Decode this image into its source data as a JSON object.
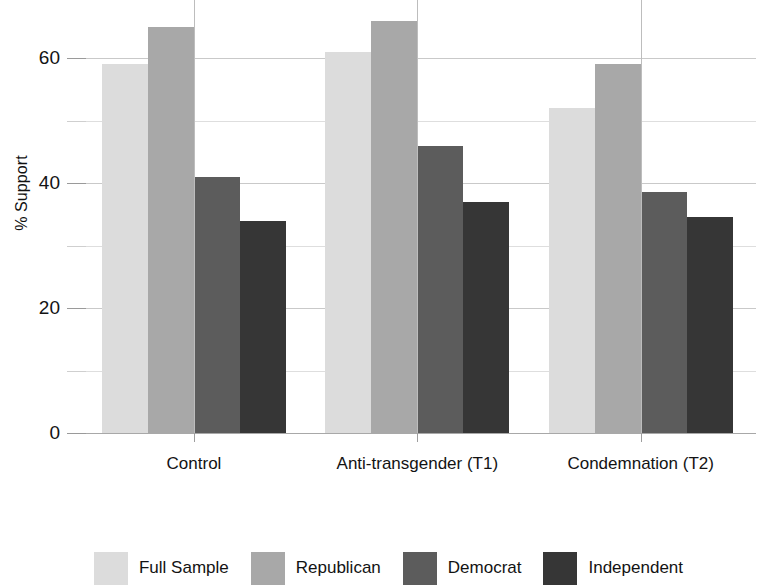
{
  "chart_data": {
    "type": "bar",
    "title": "",
    "subtitle": "",
    "xlabel": "",
    "ylabel": "% Support",
    "categories": [
      "Control",
      "Anti-transgender (T1)",
      "Condemnation (T2)"
    ],
    "series": [
      {
        "name": "Full Sample",
        "color": "#dcdcdc",
        "values": [
          59,
          61,
          52
        ]
      },
      {
        "name": "Republican",
        "color": "#a8a8a8",
        "values": [
          65,
          66,
          59
        ]
      },
      {
        "name": "Democrat",
        "color": "#5c5c5c",
        "values": [
          41,
          46,
          38.5
        ]
      },
      {
        "name": "Independent",
        "color": "#363636",
        "values": [
          34,
          37,
          34.5
        ]
      }
    ],
    "ylim": [
      0,
      68
    ],
    "yticks": [
      0,
      20,
      40,
      60
    ],
    "ytick_labels": [
      "0",
      "20",
      "40",
      "60"
    ],
    "yminor_ticks": [
      10,
      30,
      50
    ],
    "grid": true,
    "grid_axis": "y",
    "legend_position": "bottom",
    "bar_orientation": "vertical",
    "background_color": "#ffffff",
    "axis_color": "#a8a8a8",
    "grid_color": "#c9c9c9",
    "text_color": "#131313"
  },
  "legend": {
    "items": [
      {
        "label": "Full Sample"
      },
      {
        "label": "Republican"
      },
      {
        "label": "Democrat"
      },
      {
        "label": "Independent"
      }
    ]
  },
  "axes": {
    "y_title": "% Support",
    "y_tick_0": "0",
    "y_tick_1": "20",
    "y_tick_2": "40",
    "y_tick_3": "60",
    "x_tick_0": "Control",
    "x_tick_1": "Anti-transgender (T1)",
    "x_tick_2": "Condemnation (T2)"
  }
}
